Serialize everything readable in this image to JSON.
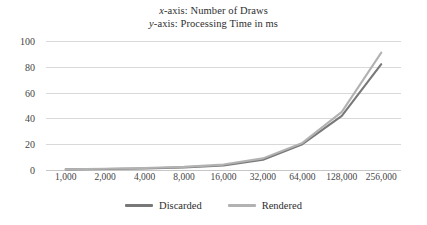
{
  "chart_data": {
    "type": "line",
    "title": "x-axis: Number of Draws\ny-axis: Processing Time in ms",
    "title_lines": [
      {
        "italic_prefix": "x",
        "rest": "-axis: Number of Draws"
      },
      {
        "italic_prefix": "y",
        "rest": "-axis: Processing Time in ms"
      }
    ],
    "xlabel": "Number of Draws",
    "ylabel": "Processing Time in ms",
    "categories": [
      "1,000",
      "2,000",
      "4,000",
      "8,000",
      "16,000",
      "32,000",
      "64,000",
      "128,000",
      "256,000"
    ],
    "ylim": [
      0,
      100
    ],
    "yticks": [
      0,
      20,
      40,
      60,
      80,
      100
    ],
    "ytick_labels": [
      "0",
      "20",
      "40",
      "60",
      "80",
      "100"
    ],
    "grid": true,
    "grid_axis": "y",
    "legend_position": "bottom-center",
    "series": [
      {
        "name": "Discarded",
        "color": "#787878",
        "values": [
          0.5,
          0.8,
          1.2,
          2.0,
          3.5,
          8.0,
          20.0,
          42.0,
          82.0
        ]
      },
      {
        "name": "Rendered",
        "color": "#b2b2b2",
        "values": [
          0.6,
          1.0,
          1.5,
          2.4,
          4.2,
          9.0,
          21.0,
          45.0,
          91.0
        ]
      }
    ]
  },
  "colors": {
    "grid": "#d9d9d9",
    "baseline": "#c6c6c6",
    "text": "#2e2e2e",
    "tick_text": "#444444"
  }
}
